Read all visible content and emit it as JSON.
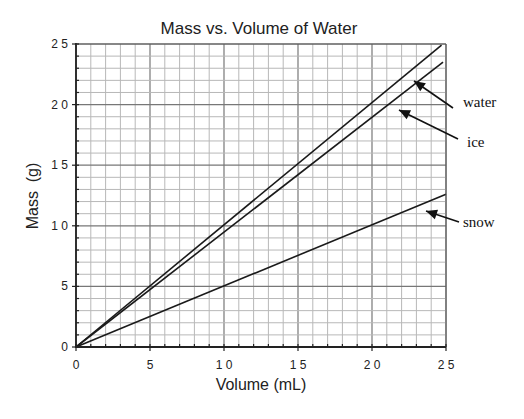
{
  "chart_data": {
    "type": "line",
    "title": "Mass vs. Volume of Water",
    "xlabel": "Volume (mL)",
    "ylabel": "Mass  (g)",
    "xlim": [
      0,
      25
    ],
    "ylim": [
      0,
      25
    ],
    "x_ticks": [
      0,
      5,
      10,
      15,
      20,
      25
    ],
    "y_ticks": [
      0,
      5,
      10,
      15,
      20,
      25
    ],
    "x_tick_labels": [
      "0",
      "5",
      "1 0",
      "1 5",
      "2 0",
      "2 5"
    ],
    "y_tick_labels": [
      "0",
      "5",
      "1 0",
      "1 5",
      "2 0",
      "2 5"
    ],
    "grid": {
      "major_step": 5,
      "minor_step": 1,
      "on": true
    },
    "legend": "arrow annotations at right",
    "series": [
      {
        "name": "water",
        "x": [
          0,
          24.7
        ],
        "y": [
          0,
          24.9
        ],
        "slope": 1.0
      },
      {
        "name": "ice",
        "x": [
          0,
          24.8
        ],
        "y": [
          0,
          23.5
        ],
        "slope": 0.92
      },
      {
        "name": "snow",
        "x": [
          0,
          25
        ],
        "y": [
          0,
          12.6
        ],
        "slope": 0.5
      }
    ],
    "annotations": [
      {
        "text": "water",
        "label_px": [
          463,
          107
        ],
        "arrow_from_px": [
          453,
          108
        ],
        "arrow_to_px": [
          414,
          81
        ]
      },
      {
        "text": "ice",
        "label_px": [
          467,
          147
        ],
        "arrow_from_px": [
          458,
          139
        ],
        "arrow_to_px": [
          399,
          110
        ]
      },
      {
        "text": "snow",
        "label_px": [
          463,
          227
        ],
        "arrow_from_px": [
          459,
          222
        ],
        "arrow_to_px": [
          426,
          211
        ]
      }
    ]
  },
  "colors": {
    "background": "#ffffff",
    "axis": "#222222",
    "major_grid": "#777777",
    "minor_grid": "#b8b8b8",
    "line": "#1a1a1a"
  }
}
